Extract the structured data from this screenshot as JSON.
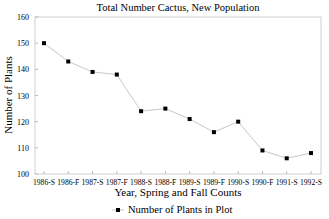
{
  "chart_data": {
    "type": "line",
    "title": "Total Number Cactus, New Population",
    "xlabel": "Year, Spring and Fall Counts",
    "ylabel": "Number of Plants",
    "categories": [
      "1986-S",
      "1986-F",
      "1987-S",
      "1987-F",
      "1988-S",
      "1988-F",
      "1989-S",
      "1989-F",
      "1990-S",
      "1990-F",
      "1991-S",
      "1992-S"
    ],
    "series": [
      {
        "name": "Number of Plants in Plot",
        "values": [
          150,
          143,
          139,
          138,
          124,
          125,
          121,
          116,
          120,
          109,
          106,
          108
        ],
        "color": "#000000",
        "line_color": "#c8c8c8",
        "marker": "square"
      }
    ],
    "ylim": [
      100,
      160
    ],
    "yticks": [
      100,
      110,
      120,
      130,
      140,
      150,
      160
    ],
    "grid": false,
    "legend_position": "bottom-center"
  },
  "legend": {
    "label": "Number of Plants in Plot"
  }
}
